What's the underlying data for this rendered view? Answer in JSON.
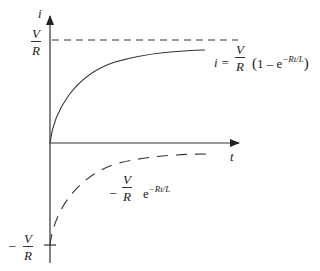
{
  "diagram": {
    "title": "",
    "axes": {
      "y_label": "i",
      "x_label": "t"
    },
    "y_ticks": {
      "top": {
        "sign": "",
        "num": "V",
        "den": "R"
      },
      "bottom": {
        "sign": "–",
        "num": "V",
        "den": "R"
      }
    },
    "curves": [
      {
        "name": "current-growth",
        "style": "solid",
        "equation": {
          "lhs": "i =",
          "num": "V",
          "den": "R",
          "paren_open": "(",
          "one_minus": "1 – e",
          "exp": "−Rt/L",
          "paren_close": ")"
        }
      },
      {
        "name": "decaying-term",
        "style": "dashed",
        "equation": {
          "sign": "–",
          "num": "V",
          "den": "R",
          "base": "e",
          "exp": "−Rt/L"
        }
      }
    ],
    "asymptote": {
      "style": "dashed",
      "value_label": "V/R"
    },
    "colors": {
      "line": "#333333",
      "background": "#ffffff"
    }
  }
}
